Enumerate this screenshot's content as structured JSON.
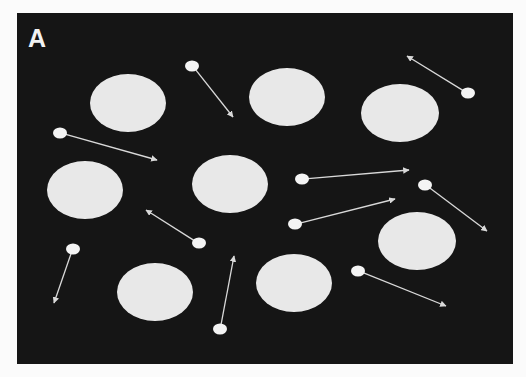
{
  "figure": {
    "panel_label": "A",
    "colors": {
      "page_background": "#fbfbfb",
      "panel_background": "#151515",
      "obstacle_fill": "#e8e8e8",
      "particle_fill": "#f4f4f4",
      "arrow_color": "#d9d9d9"
    },
    "panel": {
      "x": 17,
      "y": 13,
      "width": 496,
      "height": 351
    },
    "obstacles": [
      {
        "cx": 128,
        "cy": 103,
        "rx": 38,
        "ry": 29
      },
      {
        "cx": 287,
        "cy": 97,
        "rx": 38,
        "ry": 29
      },
      {
        "cx": 400,
        "cy": 113,
        "rx": 39,
        "ry": 29
      },
      {
        "cx": 85,
        "cy": 190,
        "rx": 38,
        "ry": 29
      },
      {
        "cx": 230,
        "cy": 184,
        "rx": 38,
        "ry": 29
      },
      {
        "cx": 417,
        "cy": 241,
        "rx": 39,
        "ry": 29
      },
      {
        "cx": 155,
        "cy": 292,
        "rx": 38,
        "ry": 29
      },
      {
        "cx": 294,
        "cy": 283,
        "rx": 38,
        "ry": 29
      }
    ],
    "particles": [
      {
        "x": 192,
        "y": 66,
        "to_x": 233,
        "to_y": 117
      },
      {
        "x": 468,
        "y": 93,
        "to_x": 407,
        "to_y": 56
      },
      {
        "x": 60,
        "y": 133,
        "to_x": 157,
        "to_y": 160
      },
      {
        "x": 302,
        "y": 179,
        "to_x": 409,
        "to_y": 170
      },
      {
        "x": 425,
        "y": 185,
        "to_x": 487,
        "to_y": 231
      },
      {
        "x": 295,
        "y": 224,
        "to_x": 395,
        "to_y": 199
      },
      {
        "x": 199,
        "y": 243,
        "to_x": 146,
        "to_y": 210
      },
      {
        "x": 73,
        "y": 249,
        "to_x": 54,
        "to_y": 303
      },
      {
        "x": 358,
        "y": 271,
        "to_x": 446,
        "to_y": 306
      },
      {
        "x": 220,
        "y": 329,
        "to_x": 234,
        "to_y": 256
      }
    ]
  }
}
